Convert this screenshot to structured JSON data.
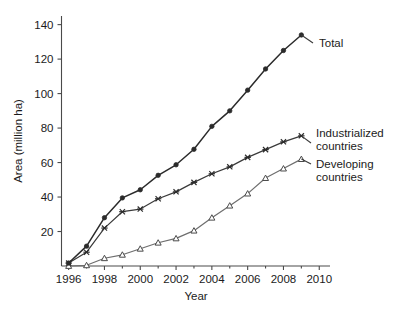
{
  "chart_data": {
    "type": "line",
    "title": "",
    "subtitle": "",
    "xlabel": "Year",
    "ylabel": "Area (million ha)",
    "xlim": [
      1995.6,
      2010.6
    ],
    "ylim": [
      0,
      145
    ],
    "grid": false,
    "legend_position": "inline-right",
    "x_tick_labels": [
      "1996",
      "1998",
      "2000",
      "2002",
      "2004",
      "2006",
      "2008",
      "2010"
    ],
    "x_tick_values": [
      1996,
      1998,
      2000,
      2002,
      2004,
      2006,
      2008,
      2010
    ],
    "x_minor_ticks": [
      1997,
      1999,
      2001,
      2003,
      2005,
      2007,
      2009
    ],
    "y_tick_labels": [
      "20",
      "40",
      "60",
      "80",
      "100",
      "120",
      "140"
    ],
    "y_tick_values": [
      20,
      40,
      60,
      80,
      100,
      120,
      140
    ],
    "x": [
      1996,
      1997,
      1998,
      1999,
      2000,
      2001,
      2002,
      2003,
      2004,
      2005,
      2006,
      2007,
      2008,
      2009
    ],
    "series": [
      {
        "name": "Total",
        "marker": "circle-filled",
        "color": "#2b2b2b",
        "values": [
          1.7,
          11.5,
          28.0,
          39.5,
          44.2,
          52.6,
          58.7,
          67.7,
          81.0,
          90.0,
          102.0,
          114.3,
          125.0,
          134.0
        ]
      },
      {
        "name": "Industrialized countries",
        "marker": "cross",
        "color": "#2b2b2b",
        "values": [
          1.7,
          8.0,
          22.0,
          31.5,
          33.0,
          39.0,
          43.0,
          48.5,
          53.5,
          57.5,
          63.0,
          67.5,
          72.0,
          75.5
        ]
      },
      {
        "name": "Developing countries",
        "marker": "triangle-open",
        "color": "#6e6e6e",
        "values": [
          0.0,
          0.4,
          4.5,
          6.5,
          10.0,
          13.5,
          16.0,
          20.5,
          28.0,
          35.0,
          42.0,
          51.0,
          56.5,
          62.0
        ]
      }
    ],
    "annotations": [
      {
        "text": "Total",
        "for_series": "Total"
      },
      {
        "text": "Industrialized",
        "for_series": "Industrialized countries"
      },
      {
        "text": "countries",
        "for_series": "Industrialized countries"
      },
      {
        "text": "Developing",
        "for_series": "Developing countries"
      },
      {
        "text": "countries",
        "for_series": "Developing countries"
      }
    ]
  },
  "axes": {
    "x_title": "Year",
    "y_title": "Area (million ha)"
  },
  "labels": {
    "total": "Total",
    "industrialized_line1": "Industrialized",
    "industrialized_line2": "countries",
    "developing_line1": "Developing",
    "developing_line2": "countries"
  },
  "x_ticks": [
    {
      "label": "1996"
    },
    {
      "label": "1998"
    },
    {
      "label": "2000"
    },
    {
      "label": "2002"
    },
    {
      "label": "2004"
    },
    {
      "label": "2006"
    },
    {
      "label": "2008"
    },
    {
      "label": "2010"
    }
  ],
  "y_ticks": [
    {
      "label": "20"
    },
    {
      "label": "40"
    },
    {
      "label": "60"
    },
    {
      "label": "80"
    },
    {
      "label": "100"
    },
    {
      "label": "120"
    },
    {
      "label": "140"
    }
  ],
  "colors": {
    "total": "#2b2b2b",
    "industrialized": "#2b2b2b",
    "developing": "#6e6e6e",
    "axis": "#4a4a4a",
    "text": "#1b1b1b",
    "background": "#ffffff"
  }
}
